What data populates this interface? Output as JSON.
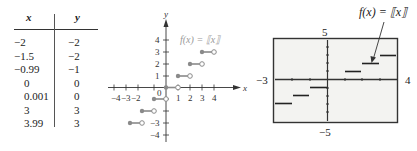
{
  "table": {
    "headers": [
      "x",
      "y"
    ],
    "rows": [
      {
        "x": "−2",
        "y": "−2"
      },
      {
        "x": "−1.5",
        "y": "−2"
      },
      {
        "x": "−0.99",
        "y": "−1"
      },
      {
        "x": "0",
        "y": "0"
      },
      {
        "x": "0.001",
        "y": "0"
      },
      {
        "x": "3",
        "y": "3"
      },
      {
        "x": "3.99",
        "y": "3"
      }
    ]
  },
  "graph": {
    "function_label": "f(x) = ⟦x⟧",
    "x_axis_label": "x",
    "y_axis_label": "y",
    "origin_label": "0",
    "x_ticks": [
      "−4",
      "−3",
      "−2",
      "1",
      "2",
      "3",
      "4"
    ],
    "y_ticks": [
      "4",
      "3",
      "2",
      "1",
      "−3",
      "−4"
    ],
    "step_color": "#8a8a8a"
  },
  "calculator": {
    "function_label": "f(x) = ⟦x⟧",
    "ymax": "5",
    "ymin": "−5",
    "xmin": "−3",
    "xmax": "4",
    "screen_color": "#f4f4f2"
  }
}
